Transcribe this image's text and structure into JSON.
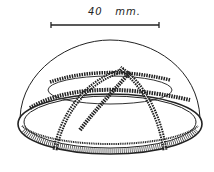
{
  "figure": {
    "scale_bar": {
      "label": "40   mm.",
      "length_value": 40,
      "unit": "mm"
    },
    "colors": {
      "ink": "#222222",
      "background": "#ffffff"
    }
  }
}
